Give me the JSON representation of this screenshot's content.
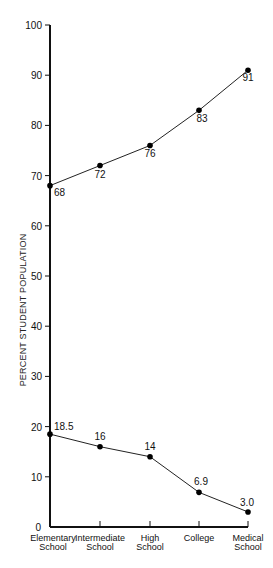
{
  "chart_data": {
    "type": "line",
    "title": "",
    "xlabel": "",
    "ylabel": "PERCENT STUDENT POPULATION",
    "ylim": [
      0,
      100
    ],
    "yticks": [
      0,
      10,
      20,
      30,
      40,
      50,
      60,
      70,
      80,
      90,
      100
    ],
    "grid": false,
    "legend": null,
    "categories": [
      [
        "Elementary",
        "School"
      ],
      [
        "Intermediate",
        "School"
      ],
      [
        "High",
        "School"
      ],
      [
        "College"
      ],
      [
        "Medical",
        "School"
      ]
    ],
    "series": [
      {
        "name": "upper",
        "values": [
          68,
          72,
          76,
          83,
          91
        ],
        "labels": [
          "68",
          "72",
          "76",
          "83",
          "91"
        ]
      },
      {
        "name": "lower",
        "values": [
          18.5,
          16,
          14,
          6.9,
          3.0
        ],
        "labels": [
          "18.5",
          "16",
          "14",
          "6.9",
          "3.0"
        ]
      }
    ]
  }
}
